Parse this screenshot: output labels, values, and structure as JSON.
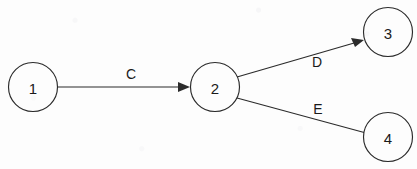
{
  "diagram": {
    "canvas": {
      "width": 417,
      "height": 169
    },
    "colors": {
      "background": "#fdfdfd",
      "stroke": "#2b2b2b",
      "text": "#1a1a1a",
      "node_fill": "#fdfdfd"
    },
    "nodes": [
      {
        "id": "1",
        "label": "1",
        "cx": 33,
        "cy": 87,
        "r": 24.5
      },
      {
        "id": "2",
        "label": "2",
        "cx": 215,
        "cy": 87,
        "r": 24.5
      },
      {
        "id": "3",
        "label": "3",
        "cx": 388,
        "cy": 32,
        "r": 24.5
      },
      {
        "id": "4",
        "label": "4",
        "cx": 388,
        "cy": 137,
        "r": 24.5
      }
    ],
    "edges": [
      {
        "id": "edge-c",
        "label": "C",
        "from": "1",
        "to": "2",
        "arrowhead": true,
        "x1": 58,
        "y1": 87,
        "x2": 190,
        "y2": 87,
        "label_x": 131,
        "label_y": 74
      },
      {
        "id": "edge-d",
        "label": "D",
        "from": "2",
        "to": "3",
        "arrowhead": true,
        "x1": 237,
        "y1": 77,
        "x2": 364,
        "y2": 40,
        "label_x": 317,
        "label_y": 62
      },
      {
        "id": "edge-e",
        "label": "E",
        "from": "2",
        "to": "4",
        "arrowhead": false,
        "x1": 237,
        "y1": 98,
        "x2": 366,
        "y2": 133,
        "label_x": 318,
        "label_y": 109
      }
    ]
  }
}
